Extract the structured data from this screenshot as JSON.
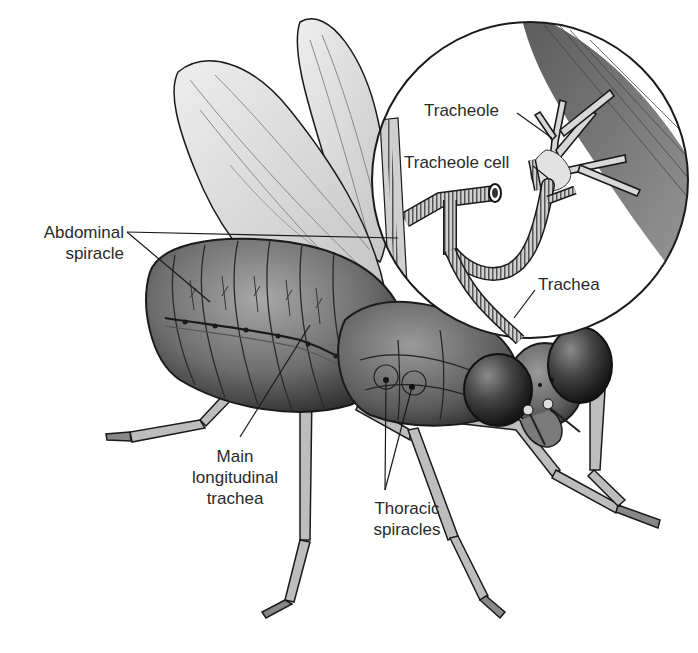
{
  "figure": {
    "labels": [
      {
        "id": "abdominal-spiracle",
        "lines": [
          "Abdominal",
          "spiracle"
        ],
        "x": 28,
        "y": 223,
        "align": "right",
        "width": 96
      },
      {
        "id": "tracheole",
        "lines": [
          "Tracheole"
        ],
        "x": 424,
        "y": 100,
        "align": "left",
        "width": 100
      },
      {
        "id": "tracheole-cell",
        "lines": [
          "Tracheole cell"
        ],
        "x": 404,
        "y": 152,
        "align": "left",
        "width": 130
      },
      {
        "id": "trachea",
        "lines": [
          "Trachea"
        ],
        "x": 538,
        "y": 274,
        "align": "left",
        "width": 80
      },
      {
        "id": "main-longitudinal-trachea",
        "lines": [
          "Main",
          "longitudinal",
          "trachea"
        ],
        "x": 178,
        "y": 446,
        "align": "center",
        "width": 110
      },
      {
        "id": "thoracic-spiracles",
        "lines": [
          "Thoracic",
          "spiracles"
        ],
        "x": 354,
        "y": 498,
        "align": "center",
        "width": 110
      }
    ],
    "leader_lines": [
      {
        "label": "abdominal-spiracle",
        "from": [
          127,
          232
        ],
        "to": [
          398,
          238
        ]
      },
      {
        "label": "abdominal-spiracle",
        "from": [
          127,
          232
        ],
        "to": [
          210,
          302
        ]
      },
      {
        "label": "tracheole",
        "from": [
          517,
          113
        ],
        "to": [
          552,
          138
        ]
      },
      {
        "label": "tracheole-cell",
        "from": [
          533,
          166
        ],
        "to": [
          548,
          178
        ]
      },
      {
        "label": "trachea",
        "from": [
          535,
          290
        ],
        "to": [
          514,
          318
        ]
      },
      {
        "label": "main-longitudinal-trachea",
        "from": [
          240,
          437
        ],
        "to": [
          310,
          325
        ]
      },
      {
        "label": "thoracic-spiracles",
        "from": [
          385,
          490
        ],
        "to": [
          386,
          380
        ]
      },
      {
        "label": "thoracic-spiracles",
        "from": [
          385,
          490
        ],
        "to": [
          412,
          387
        ]
      }
    ],
    "colors": {
      "ink": "#1a1a1a",
      "body_dark": "#3c3c3c",
      "body_mid": "#6e6e6e",
      "body_light": "#a8a8a8",
      "wing": "#d9d9d9",
      "muscle": "#7a7a7a",
      "background": "#ffffff"
    }
  }
}
